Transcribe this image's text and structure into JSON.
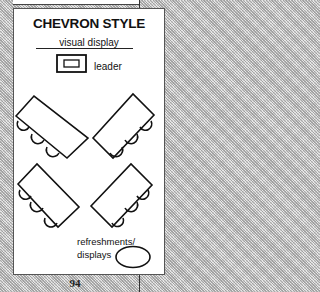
{
  "diagram": {
    "title": "CHEVRON STYLE",
    "visual_display_label": "visual display",
    "leader_label": "leader",
    "refreshments_label_line1": "refreshments/",
    "refreshments_label_line2": "displays",
    "tables": [
      {
        "position": "upper-left",
        "orientation": "chevron-left",
        "chairs": 3
      },
      {
        "position": "upper-right",
        "orientation": "chevron-right",
        "chairs": 3
      },
      {
        "position": "lower-left",
        "orientation": "chevron-left",
        "chairs": 3
      },
      {
        "position": "lower-right",
        "orientation": "chevron-right",
        "chairs": 3
      }
    ]
  },
  "page": {
    "number": "94"
  },
  "colors": {
    "line": "#111111",
    "card": "#ffffff",
    "background": "#cfcfcf"
  }
}
